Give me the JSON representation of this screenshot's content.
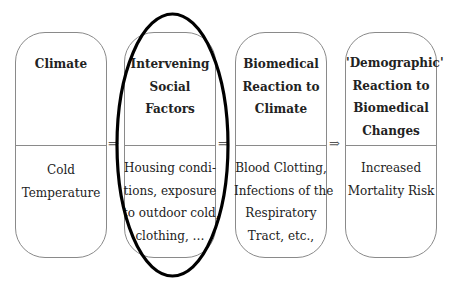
{
  "boxes": [
    {
      "header": [
        "Climate"
      ],
      "body": [
        "Cold",
        "Temperature"
      ]
    },
    {
      "header": [
        "Intervening",
        "Social",
        "Factors"
      ],
      "body": [
        "Housing condi-",
        "tions, exposure",
        "to outdoor cold,",
        "clothing, …"
      ]
    },
    {
      "header": [
        "Biomedical",
        "Reaction to",
        "Climate"
      ],
      "body": [
        "Blood Clotting,",
        "Infections of the",
        "Respiratory",
        "Tract, etc.,"
      ]
    },
    {
      "header": [
        "'Demographic'",
        "Reaction to",
        "Biomedical",
        "Changes"
      ],
      "body": [
        "Increased",
        "Mortality Risk"
      ]
    }
  ],
  "arrows": [
    "⇒",
    "⇒",
    "⇒"
  ],
  "highlight": {
    "shape": "ellipse",
    "target": "Intervening Social Factors",
    "color": "#000000"
  }
}
